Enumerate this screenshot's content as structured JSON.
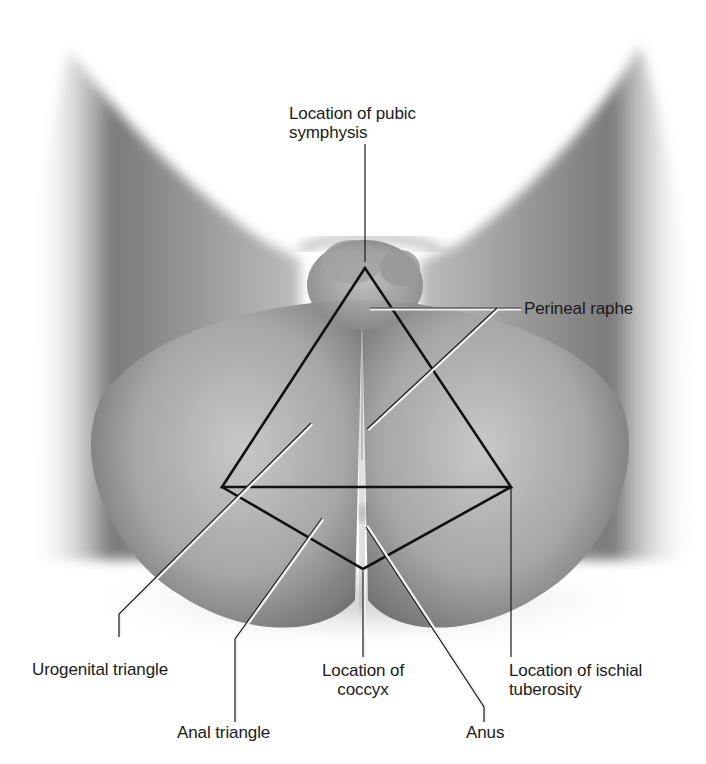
{
  "figure": {
    "labels": {
      "pubic_symphysis": "Location of pubic\nsymphysis",
      "perineal_raphe": "Perineal raphe",
      "urogenital_triangle": "Urogenital triangle",
      "anal_triangle": "Anal triangle",
      "coccyx": "Location of\ncoccyx",
      "ischial_tuberosity": "Location of ischial\ntuberosity",
      "anus": "Anus"
    },
    "colors": {
      "background": "#ffffff",
      "skin_dark": "#6f6f6f",
      "skin_mid": "#a9a9a9",
      "skin_light": "#d9d9d9",
      "outline": "#111111",
      "leader_highlight": "#f2f2f2"
    }
  }
}
